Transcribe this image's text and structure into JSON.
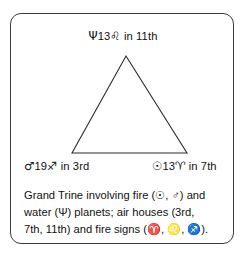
{
  "figure": {
    "type": "astrological-aspect-diagram",
    "shape": "triangle",
    "border_color": "#3a3a3a",
    "line_color": "#2b2b2b",
    "background_color": "#ffffff"
  },
  "nodes": [
    {
      "id": "neptune",
      "position": "apex-top",
      "planet_glyph": "Ψ",
      "planet_name": "Neptune",
      "degree": "13",
      "sign_glyph": "♌",
      "sign_name": "Leo",
      "house_text": " in 11th",
      "full_text": "Ψ13♌ in 11th"
    },
    {
      "id": "mars",
      "position": "bottom-left",
      "planet_glyph": "♂",
      "planet_name": "Mars",
      "degree": "19",
      "sign_glyph": "♐",
      "sign_name": "Sagittarius",
      "house_text": " in 3rd",
      "full_text": "♂19♐ in 3rd"
    },
    {
      "id": "sun",
      "position": "bottom-right",
      "planet_glyph": "☉",
      "planet_name": "Sun",
      "degree": "13",
      "sign_glyph": "♈",
      "sign_name": "Aries",
      "house_text": " in 7th",
      "full_text": "☉13♈ in 7th"
    }
  ],
  "caption": {
    "line1": "Grand Trine involving fire (☉, ♂) and",
    "line2": "water (Ψ) planets; air houses (3rd,",
    "line3": "7th, 11th) and fire signs (♈, ♌, ♐).",
    "full_text": "Grand Trine involving fire (☉, ♂) and water (Ψ) planets; air houses (3rd, 7th, 11th) and fire signs (♈, ♌, ♐)."
  }
}
